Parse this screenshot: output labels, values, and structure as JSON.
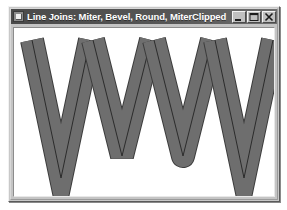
{
  "window": {
    "title": "Line Joins: Miter, Bevel, Round, MiterClipped",
    "icon_name": "application-icon",
    "controls": [
      {
        "name": "minimize-button",
        "label": "–",
        "glyph": "minimize"
      },
      {
        "name": "maximize-button",
        "label": "□",
        "glyph": "maximize"
      },
      {
        "name": "close-button",
        "label": "✕",
        "glyph": "close"
      }
    ]
  },
  "canvas": {
    "background": "#ffffff",
    "width": 262,
    "height": 168,
    "stroke_fill": "#6e6e6e",
    "stroke_outline": "#3c3c3c",
    "center_line": "#2b2b2b",
    "stroke_width": 22,
    "outline_width": 1,
    "center_line_width": 1
  },
  "shapes": [
    {
      "name": "v-shape-miter",
      "join": "miter",
      "label": "Miter",
      "points": [
        [
          18,
          12
        ],
        [
          47,
          150
        ],
        [
          76,
          12
        ]
      ],
      "apex": [
        47,
        150
      ],
      "miter_limit": 20
    },
    {
      "name": "v-shape-bevel",
      "join": "bevel",
      "label": "Bevel",
      "points": [
        [
          79,
          12
        ],
        [
          108,
          128
        ],
        [
          137,
          12
        ]
      ],
      "apex": [
        108,
        128
      ],
      "miter_limit": 0
    },
    {
      "name": "v-shape-round",
      "join": "round",
      "label": "Round",
      "points": [
        [
          140,
          12
        ],
        [
          169,
          128
        ],
        [
          198,
          12
        ]
      ],
      "apex": [
        169,
        128
      ],
      "miter_limit": 0
    },
    {
      "name": "v-shape-miter-clipped",
      "join": "miter-clip",
      "label": "MiterClipped",
      "points": [
        [
          201,
          12
        ],
        [
          230,
          150
        ],
        [
          259,
          12
        ]
      ],
      "apex": [
        230,
        150
      ],
      "miter_limit": 18
    }
  ]
}
